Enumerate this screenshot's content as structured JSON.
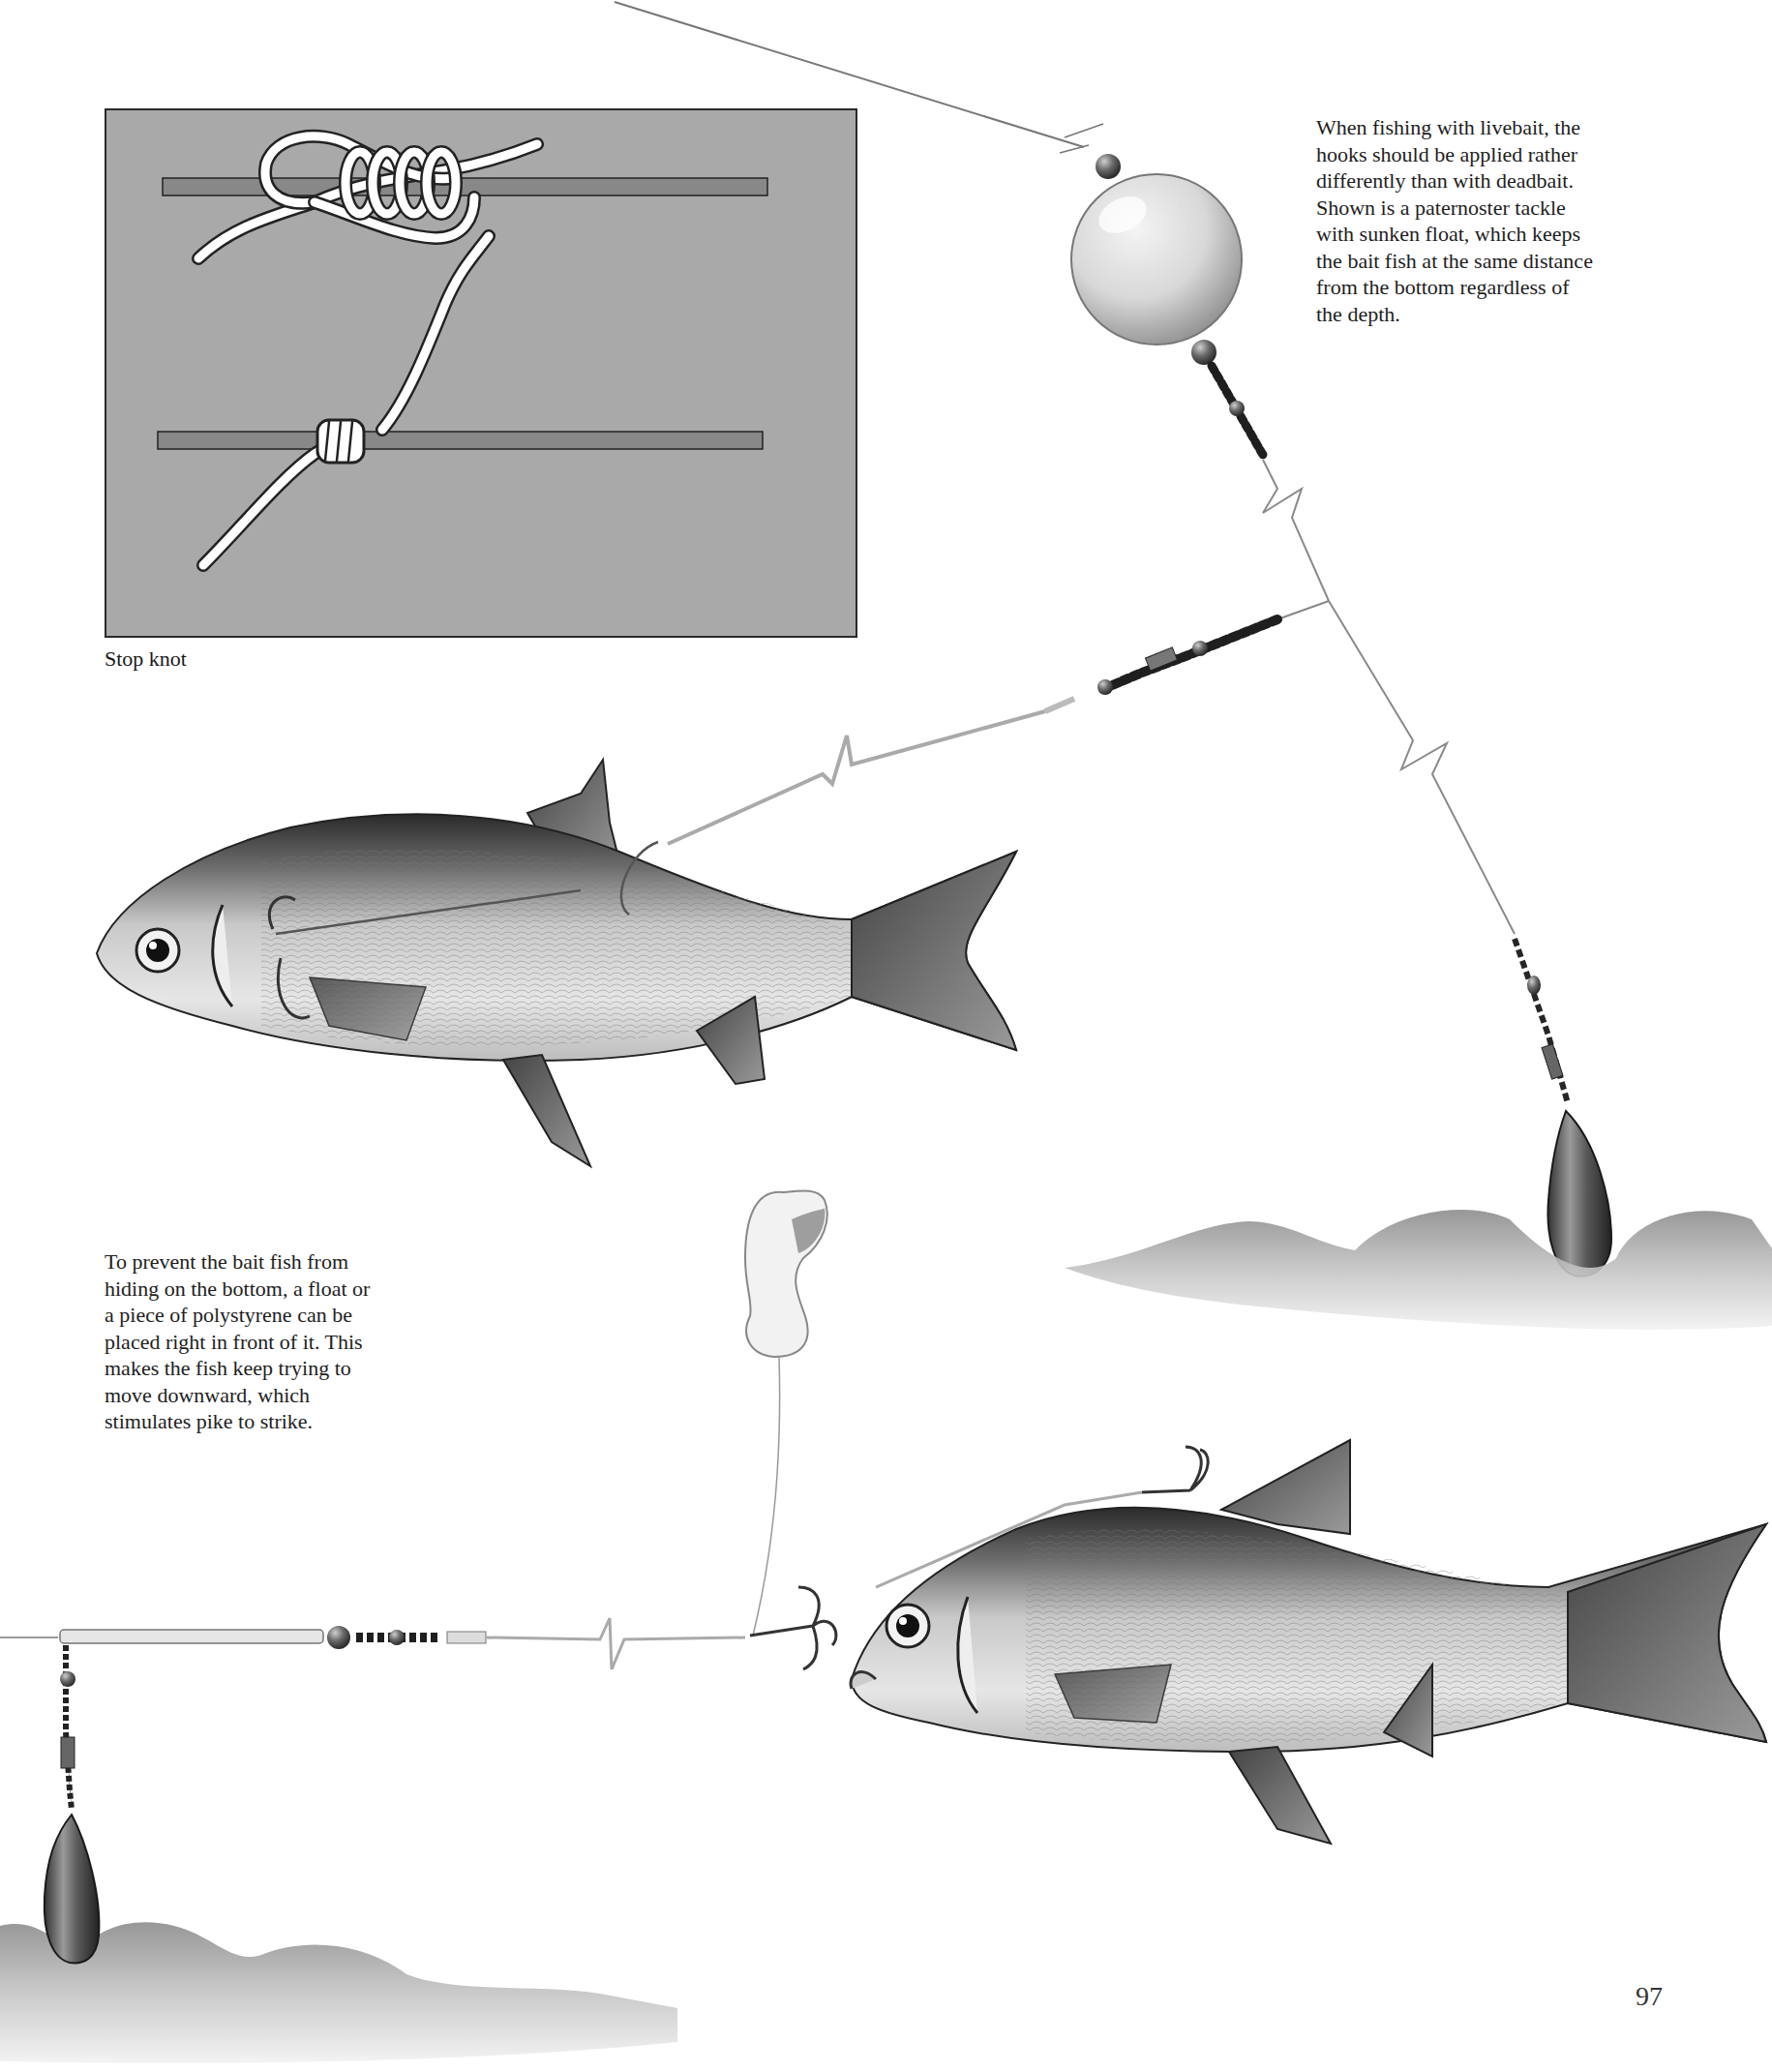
{
  "page": {
    "number": "97"
  },
  "stop_knot": {
    "label": "Stop knot",
    "box_color": "#a9a9a9"
  },
  "captions": {
    "livebait": {
      "lines": [
        "When fishing with livebait, the",
        "hooks should be applied rather",
        "differently than with deadbait.",
        "Shown is a paternoster tackle",
        "with sunken float, which keeps",
        "the bait fish at the same distance",
        "from the bottom regardless of",
        "the depth."
      ]
    },
    "polystyrene": {
      "lines": [
        "To prevent the bait fish from",
        "hiding on the bottom, a float or",
        "a piece of polystyrene can be",
        "placed right in front of it. This",
        "makes the fish keep trying to",
        "move downward, which",
        "stimulates pike to strike."
      ]
    }
  },
  "illustrations": {
    "top_rig": [
      "sunken-float",
      "beads",
      "swivel",
      "paternoster-line",
      "trace",
      "treble-hooks",
      "bait-fish",
      "sinker",
      "riverbed"
    ],
    "bottom_rig": [
      "polystyrene-float",
      "trace",
      "treble-hooks",
      "bait-fish",
      "boom-tube",
      "swivel",
      "sinker",
      "riverbed"
    ]
  }
}
